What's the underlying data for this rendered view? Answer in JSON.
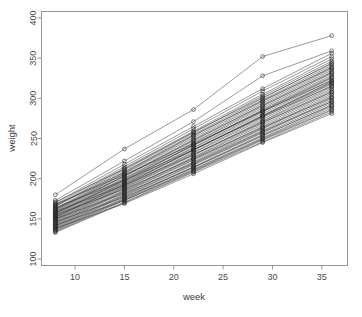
{
  "chart_data": {
    "type": "line",
    "title": "",
    "subtitle": "",
    "xlabel": "week",
    "ylabel": "weight",
    "xlim": [
      6.6,
      37.6
    ],
    "ylim": [
      92,
      408
    ],
    "x": [
      8,
      15,
      22,
      29,
      36
    ],
    "xticks": [
      10,
      15,
      20,
      25,
      30,
      35
    ],
    "xticklabels": [
      "10",
      "15",
      "20",
      "25",
      "30",
      "35"
    ],
    "yticks": [
      100,
      150,
      200,
      250,
      300,
      350,
      400
    ],
    "yticklabels": [
      "100",
      "150",
      "200",
      "250",
      "300",
      "350",
      "400"
    ],
    "grid": false,
    "legend": "none",
    "marker": "open-circle",
    "line_color": "#1e1e1e",
    "point_color": "#2a2a2a",
    "frame_color": "#8a8a8a",
    "background": "#ffffff",
    "series": [
      {
        "name": "subject-01",
        "values": [
          180,
          237,
          286,
          352,
          378
        ]
      },
      {
        "name": "subject-02",
        "values": [
          173,
          222,
          271,
          328,
          359
        ]
      },
      {
        "name": "subject-03",
        "values": [
          170,
          218,
          265,
          312,
          356
        ]
      },
      {
        "name": "subject-04",
        "values": [
          168,
          215,
          262,
          309,
          352
        ]
      },
      {
        "name": "subject-05",
        "values": [
          166,
          213,
          259,
          305,
          349
        ]
      },
      {
        "name": "subject-06",
        "values": [
          165,
          211,
          257,
          303,
          346
        ]
      },
      {
        "name": "subject-07",
        "values": [
          163,
          209,
          255,
          300,
          344
        ]
      },
      {
        "name": "subject-08",
        "values": [
          162,
          207,
          253,
          298,
          341
        ]
      },
      {
        "name": "subject-09",
        "values": [
          161,
          206,
          251,
          296,
          339
        ]
      },
      {
        "name": "subject-10",
        "values": [
          160,
          204,
          249,
          294,
          337
        ]
      },
      {
        "name": "subject-11",
        "values": [
          159,
          203,
          247,
          292,
          335
        ]
      },
      {
        "name": "subject-12",
        "values": [
          158,
          201,
          245,
          290,
          333
        ]
      },
      {
        "name": "subject-13",
        "values": [
          157,
          200,
          244,
          288,
          331
        ]
      },
      {
        "name": "subject-14",
        "values": [
          156,
          199,
          242,
          286,
          329
        ]
      },
      {
        "name": "subject-15",
        "values": [
          155,
          198,
          241,
          285,
          327
        ]
      },
      {
        "name": "subject-16",
        "values": [
          154,
          196,
          239,
          283,
          325
        ]
      },
      {
        "name": "subject-17",
        "values": [
          153,
          195,
          238,
          281,
          323
        ]
      },
      {
        "name": "subject-18",
        "values": [
          152,
          194,
          236,
          279,
          321
        ]
      },
      {
        "name": "subject-19",
        "values": [
          151,
          193,
          235,
          278,
          320
        ]
      },
      {
        "name": "subject-20",
        "values": [
          150,
          191,
          233,
          276,
          318
        ]
      },
      {
        "name": "subject-21",
        "values": [
          149,
          190,
          232,
          274,
          316
        ]
      },
      {
        "name": "subject-22",
        "values": [
          148,
          189,
          230,
          272,
          314
        ]
      },
      {
        "name": "subject-23",
        "values": [
          147,
          188,
          229,
          271,
          312
        ]
      },
      {
        "name": "subject-24",
        "values": [
          146,
          186,
          227,
          269,
          310
        ]
      },
      {
        "name": "subject-25",
        "values": [
          145,
          185,
          226,
          267,
          308
        ]
      },
      {
        "name": "subject-26",
        "values": [
          144,
          184,
          224,
          265,
          306
        ]
      },
      {
        "name": "subject-27",
        "values": [
          143,
          183,
          223,
          263,
          304
        ]
      },
      {
        "name": "subject-28",
        "values": [
          142,
          181,
          221,
          262,
          302
        ]
      },
      {
        "name": "subject-29",
        "values": [
          141,
          180,
          220,
          260,
          300
        ]
      },
      {
        "name": "subject-30",
        "values": [
          140,
          179,
          218,
          258,
          298
        ]
      },
      {
        "name": "subject-31",
        "values": [
          139,
          178,
          217,
          257,
          296
        ]
      },
      {
        "name": "subject-32",
        "values": [
          138,
          176,
          215,
          255,
          294
        ]
      },
      {
        "name": "subject-33",
        "values": [
          137,
          175,
          214,
          253,
          292
        ]
      },
      {
        "name": "subject-34",
        "values": [
          136,
          174,
          212,
          251,
          290
        ]
      },
      {
        "name": "subject-35",
        "values": [
          135,
          173,
          211,
          250,
          288
        ]
      },
      {
        "name": "subject-36",
        "values": [
          134,
          171,
          209,
          248,
          285
        ]
      },
      {
        "name": "subject-37",
        "values": [
          133,
          170,
          208,
          246,
          283
        ]
      },
      {
        "name": "subject-38",
        "values": [
          168,
          205,
          243,
          284,
          322
        ]
      },
      {
        "name": "subject-39",
        "values": [
          164,
          198,
          236,
          277,
          315
        ]
      },
      {
        "name": "subject-40",
        "values": [
          159,
          192,
          230,
          270,
          308
        ]
      },
      {
        "name": "subject-41",
        "values": [
          155,
          187,
          225,
          264,
          301
        ]
      },
      {
        "name": "subject-42",
        "values": [
          150,
          182,
          219,
          259,
          296
        ]
      },
      {
        "name": "subject-43",
        "values": [
          146,
          177,
          214,
          254,
          291
        ]
      },
      {
        "name": "subject-44",
        "values": [
          142,
          173,
          210,
          249,
          286
        ]
      },
      {
        "name": "subject-45",
        "values": [
          138,
          169,
          206,
          245,
          281
        ]
      },
      {
        "name": "subject-46",
        "values": [
          171,
          212,
          258,
          301,
          343
        ]
      },
      {
        "name": "subject-47",
        "values": [
          167,
          208,
          254,
          297,
          338
        ]
      },
      {
        "name": "subject-48",
        "values": [
          162,
          203,
          248,
          291,
          332
        ]
      },
      {
        "name": "subject-49",
        "values": [
          157,
          197,
          242,
          284,
          326
        ]
      },
      {
        "name": "subject-50",
        "values": [
          152,
          192,
          236,
          278,
          319
        ]
      }
    ]
  },
  "plot": {
    "xlabel": "week",
    "ylabel": "weight"
  }
}
